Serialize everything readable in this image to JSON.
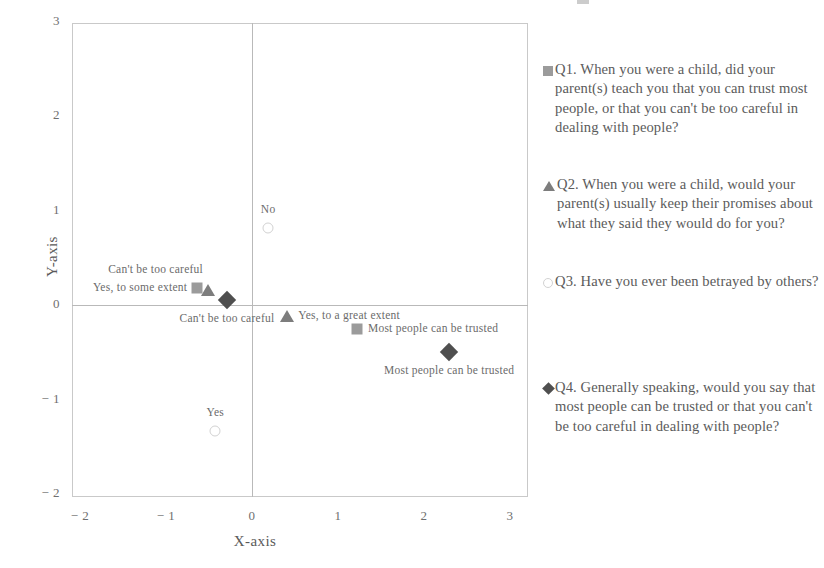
{
  "chart_data": {
    "type": "scatter",
    "title": "",
    "xlabel": "X-axis",
    "ylabel": "Y-axis",
    "xlim": [
      -2,
      3
    ],
    "ylim": [
      -2,
      3
    ],
    "xticks": [
      "− 2",
      "− 1",
      "0",
      "1",
      "2",
      "3"
    ],
    "xtick_values": [
      -2,
      -1,
      0,
      1,
      2,
      3
    ],
    "yticks": [
      "3",
      "2",
      "1",
      "0",
      "− 1",
      "− 2"
    ],
    "ytick_values": [
      3,
      2,
      1,
      0,
      -1,
      -2
    ],
    "grid": false,
    "quadrant_lines": true,
    "legend_position": "right",
    "series": [
      {
        "name": "Q1",
        "marker": "square",
        "color": "#9b9b9b",
        "points": [
          {
            "x": -0.64,
            "y": 0.18,
            "label": "Yes, to some extent",
            "label_pos": "left"
          },
          {
            "x": 1.22,
            "y": -0.25,
            "label": "Most people can be trusted",
            "label_pos": "right"
          }
        ]
      },
      {
        "name": "Q2",
        "marker": "triangle",
        "color": "#7d7d7d",
        "points": [
          {
            "x": -0.51,
            "y": 0.16,
            "label": "Can't be too careful",
            "label_pos": "above-left"
          },
          {
            "x": 0.41,
            "y": -0.12,
            "label": "Yes, to a great extent",
            "label_pos": "right"
          }
        ]
      },
      {
        "name": "Q3",
        "marker": "circle",
        "color": "#d2d2d2",
        "points": [
          {
            "x": 0.19,
            "y": 0.81,
            "label": "No",
            "label_pos": "above"
          },
          {
            "x": -0.43,
            "y": -1.33,
            "label": "Yes",
            "label_pos": "above"
          }
        ]
      },
      {
        "name": "Q4",
        "marker": "diamond",
        "color": "#4f4f4f",
        "points": [
          {
            "x": -0.29,
            "y": 0.05,
            "label": "Can't be too careful",
            "label_pos": "below"
          },
          {
            "x": 2.29,
            "y": -0.5,
            "label": "Most people can be trusted",
            "label_pos": "below"
          }
        ]
      }
    ],
    "legend": [
      {
        "key": "Q1",
        "marker": "square",
        "color": "#9b9b9b",
        "text": "Q1. When you were a child, did your parent(s) teach you that you can trust most people, or that you can't be too careful in dealing with people?"
      },
      {
        "key": "Q2",
        "marker": "triangle",
        "color": "#7d7d7d",
        "text": "Q2. When you were a child, would your parent(s) usually keep their promises about what they said they would do for you?"
      },
      {
        "key": "Q3",
        "marker": "circle",
        "color": "#d2d2d2",
        "text": "Q3. Have you ever been betrayed by others?"
      },
      {
        "key": "Q4",
        "marker": "diamond",
        "color": "#4f4f4f",
        "text": "Q4. Generally speaking, would you say that most people can be trusted or that you can't be too careful in dealing with people?"
      }
    ]
  },
  "axes": {
    "x_title": "X-axis",
    "y_title": "Y-axis"
  }
}
